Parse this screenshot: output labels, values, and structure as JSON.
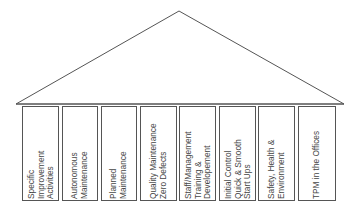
{
  "diagram": {
    "roof": {
      "apex": [
        179,
        11
      ],
      "left": [
        16,
        104
      ],
      "right": [
        344,
        104
      ],
      "stroke": "#555555"
    },
    "pillars": [
      {
        "label": "Specific\nImprovement\nActivities",
        "x": 22,
        "w": 37
      },
      {
        "label": "Autonomous\nMaintenance",
        "x": 62,
        "w": 36
      },
      {
        "label": "Planned\nMaintenance",
        "x": 101,
        "w": 36
      },
      {
        "label": "Quality Maintenance\nZero Defects",
        "x": 140,
        "w": 37
      },
      {
        "label": "Staff/Management\nTraining &\nDevelopement",
        "x": 179,
        "w": 37
      },
      {
        "label": "Initial Control\nQuick & Smooth\nStart Ups",
        "x": 219,
        "w": 37
      },
      {
        "label": "Safety, Health &\nEnvironment",
        "x": 258,
        "w": 37
      },
      {
        "label": "TPM in the Offices",
        "x": 298,
        "w": 38
      }
    ]
  }
}
